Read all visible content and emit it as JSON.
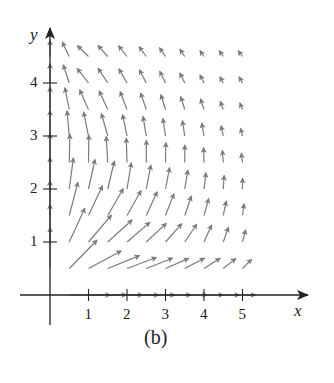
{
  "chart_data": {
    "type": "vector_field",
    "title": "",
    "caption": "(b)",
    "xlabel": "x",
    "ylabel": "y",
    "x_ticks": [
      "1",
      "2",
      "3",
      "4",
      "5"
    ],
    "y_ticks": [
      "1",
      "2",
      "3",
      "4"
    ],
    "xlim": [
      0,
      6.2
    ],
    "ylim": [
      0,
      5
    ],
    "grid": false,
    "arrow_color": "#7a7a7a",
    "axis_color": "#222222",
    "grid_spacing": {
      "dx": 0.5,
      "dy": 0.5
    },
    "columns": 11,
    "rows": 10
  },
  "layout": {
    "origin_px": [
      50,
      295
    ],
    "unit_x_px": 38.5,
    "unit_y_px": 53,
    "x_axis_end_px": 308,
    "y_axis_top_px": 28
  }
}
